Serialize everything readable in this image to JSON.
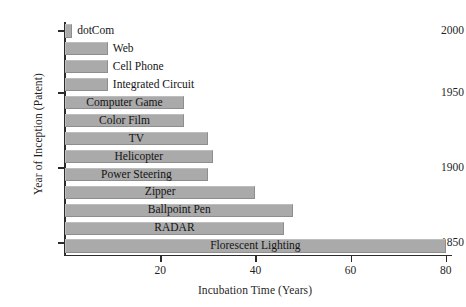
{
  "chart_data": {
    "type": "bar",
    "orientation": "horizontal",
    "title": "",
    "xlabel": "Incubation Time (Years)",
    "ylabel": "Year of Inception (Patent)",
    "xlim": [
      0,
      82
    ],
    "xticks": [
      20,
      40,
      60,
      80
    ],
    "xtick_labels": [
      "20",
      "40",
      "60",
      "80"
    ],
    "yticks": [
      2000,
      1950,
      1900,
      1850
    ],
    "ytick_labels": [
      "2000",
      "1950",
      "1900",
      "1850"
    ],
    "grid": false,
    "legend": false,
    "bar_color": "#aaaaaa",
    "bar_edge_color": "#8e8e8e",
    "categories": [
      "dotCom",
      "Web",
      "Cell Phone",
      "Integrated Circuit",
      "Computer Game",
      "Color Film",
      "TV",
      "Helicopter",
      "Power Steering",
      "Zipper",
      "Ballpoint Pen",
      "RADAR",
      "Florescent Lighting"
    ],
    "values": [
      1.5,
      9,
      9,
      9,
      25,
      25,
      30,
      31,
      30,
      40,
      48,
      46,
      80
    ],
    "years": [
      2000,
      1992,
      1983,
      1958,
      1950,
      1935,
      1926,
      1922,
      1900,
      1893,
      1888,
      1887,
      1852
    ],
    "label_placement": [
      "outside",
      "outside",
      "outside",
      "outside",
      "inside",
      "inside",
      "inside",
      "inside",
      "inside",
      "inside",
      "inside",
      "inside",
      "inside"
    ]
  }
}
